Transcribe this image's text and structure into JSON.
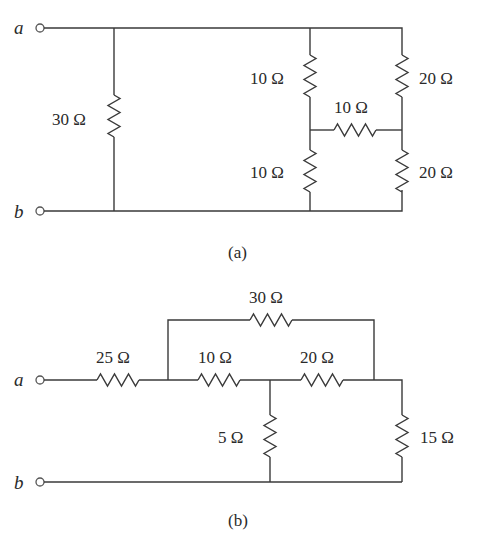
{
  "figure_a": {
    "caption": "(a)",
    "terminals": {
      "a": "a",
      "b": "b"
    },
    "resistors": [
      {
        "id": "R30",
        "label": "30 Ω",
        "orientation": "vertical",
        "position": "shunt across a-b"
      },
      {
        "id": "R10_upper",
        "label": "10 Ω",
        "orientation": "vertical",
        "position": "left bridge arm upper"
      },
      {
        "id": "R10_mid",
        "label": "10 Ω",
        "orientation": "horizontal",
        "position": "bridge middle"
      },
      {
        "id": "R10_lower",
        "label": "10 Ω",
        "orientation": "vertical",
        "position": "left bridge arm lower"
      },
      {
        "id": "R20_upper",
        "label": "20 Ω",
        "orientation": "vertical",
        "position": "right bridge arm upper"
      },
      {
        "id": "R20_lower",
        "label": "20 Ω",
        "orientation": "vertical",
        "position": "right bridge arm lower"
      }
    ]
  },
  "figure_b": {
    "caption": "(b)",
    "terminals": {
      "a": "a",
      "b": "b"
    },
    "resistors": [
      {
        "id": "R25",
        "label": "25 Ω",
        "orientation": "horizontal",
        "position": "series from a"
      },
      {
        "id": "R30",
        "label": "30 Ω",
        "orientation": "horizontal",
        "position": "top bypass loop"
      },
      {
        "id": "R10",
        "label": "10 Ω",
        "orientation": "horizontal",
        "position": "main line left"
      },
      {
        "id": "R20",
        "label": "20 Ω",
        "orientation": "horizontal",
        "position": "main line right"
      },
      {
        "id": "R5",
        "label": "5 Ω",
        "orientation": "vertical",
        "position": "shunt to b line"
      },
      {
        "id": "R15",
        "label": "15 Ω",
        "orientation": "vertical",
        "position": "right shunt to b line"
      }
    ]
  }
}
